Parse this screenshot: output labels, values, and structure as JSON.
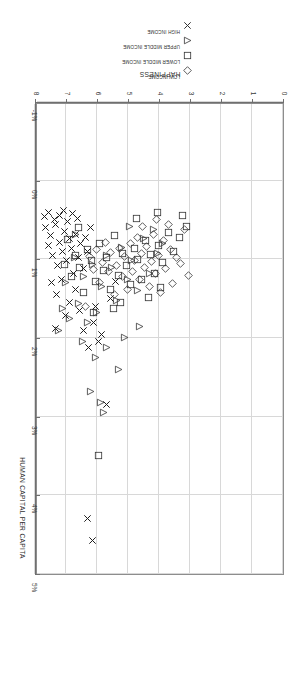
{
  "chart_data": {
    "type": "scatter",
    "title": "",
    "xlabel": "HAPPINESS",
    "ylabel": "HUMAN CAPITAL PER CAPITA",
    "xlim": [
      0,
      8
    ],
    "ylim": [
      -0.01,
      0.05
    ],
    "x_ticks": [
      "0",
      "1",
      "2",
      "3",
      "4",
      "5",
      "6",
      "7",
      "8"
    ],
    "x_tick_values": [
      0,
      1,
      2,
      3,
      4,
      5,
      6,
      7,
      8
    ],
    "y_ticks": [
      "-1%",
      "0%",
      "1%",
      "2%",
      "3%",
      "4%",
      "5%"
    ],
    "y_tick_values": [
      -0.01,
      0,
      0.01,
      0.02,
      0.03,
      0.04,
      0.05
    ],
    "grid": true,
    "rotated_180": true,
    "legend_position": "top-center",
    "series": [
      {
        "name": "LOW INCOME",
        "marker": "diamond",
        "color": "#333333",
        "points": [
          [
            3.05,
            0.012
          ],
          [
            3.3,
            0.0105
          ],
          [
            3.42,
            0.0098
          ],
          [
            3.55,
            0.0131
          ],
          [
            3.62,
            0.0088
          ],
          [
            3.78,
            0.0112
          ],
          [
            3.85,
            0.0076
          ],
          [
            3.95,
            0.0142
          ],
          [
            4.02,
            0.0095
          ],
          [
            4.1,
            0.0118
          ],
          [
            4.18,
            0.0068
          ],
          [
            4.25,
            0.0103
          ],
          [
            4.32,
            0.0135
          ],
          [
            4.4,
            0.0084
          ],
          [
            4.48,
            0.011
          ],
          [
            4.55,
            0.0092
          ],
          [
            4.62,
            0.0126
          ],
          [
            4.7,
            0.0072
          ],
          [
            4.78,
            0.0101
          ],
          [
            4.85,
            0.0115
          ],
          [
            4.92,
            0.008
          ],
          [
            5.02,
            0.0138
          ],
          [
            5.1,
            0.0097
          ],
          [
            5.18,
            0.0122
          ],
          [
            5.28,
            0.0086
          ],
          [
            5.38,
            0.0108
          ],
          [
            5.45,
            0.0145
          ],
          [
            5.55,
            0.0091
          ],
          [
            5.62,
            0.0116
          ],
          [
            5.72,
            0.0078
          ],
          [
            5.82,
            0.0104
          ],
          [
            5.92,
            0.0129
          ],
          [
            6.02,
            0.0088
          ],
          [
            6.12,
            0.0113
          ],
          [
            6.25,
            0.0096
          ],
          [
            6.38,
            0.016
          ],
          [
            3.18,
            0.0062
          ],
          [
            3.68,
            0.0056
          ],
          [
            4.08,
            0.005
          ],
          [
            4.52,
            0.0058
          ]
        ]
      },
      {
        "name": "LOWER MIDDLE INCOME",
        "marker": "square",
        "color": "#333333",
        "points": [
          [
            3.1,
            0.0058
          ],
          [
            3.35,
            0.0072
          ],
          [
            3.52,
            0.009
          ],
          [
            3.7,
            0.0066
          ],
          [
            3.88,
            0.0104
          ],
          [
            4.0,
            0.0082
          ],
          [
            4.15,
            0.0118
          ],
          [
            4.28,
            0.0094
          ],
          [
            4.42,
            0.0076
          ],
          [
            4.55,
            0.0126
          ],
          [
            4.68,
            0.01
          ],
          [
            4.8,
            0.0086
          ],
          [
            4.92,
            0.0132
          ],
          [
            5.05,
            0.0108
          ],
          [
            5.18,
            0.0092
          ],
          [
            5.3,
            0.012
          ],
          [
            5.42,
            0.007
          ],
          [
            5.55,
            0.0138
          ],
          [
            5.68,
            0.0098
          ],
          [
            5.8,
            0.0114
          ],
          [
            5.92,
            0.008
          ],
          [
            6.05,
            0.0128
          ],
          [
            6.18,
            0.0102
          ],
          [
            6.3,
            0.0088
          ],
          [
            6.42,
            0.0142
          ],
          [
            6.55,
            0.011
          ],
          [
            6.68,
            0.0095
          ],
          [
            6.82,
            0.0122
          ],
          [
            6.95,
            0.0075
          ],
          [
            7.05,
            0.0106
          ],
          [
            4.35,
            0.0148
          ],
          [
            5.48,
            0.0162
          ],
          [
            3.95,
            0.0136
          ],
          [
            6.1,
            0.0168
          ],
          [
            5.25,
            0.0155
          ],
          [
            5.95,
            0.035
          ],
          [
            3.25,
            0.0044
          ],
          [
            4.05,
            0.004
          ],
          [
            4.72,
            0.0048
          ],
          [
            6.6,
            0.006
          ]
        ]
      },
      {
        "name": "UPPER MIDDLE INCOME",
        "marker": "triangle-left",
        "color": "#333333",
        "points": [
          [
            4.05,
            0.0092
          ],
          [
            4.3,
            0.0118
          ],
          [
            4.5,
            0.0074
          ],
          [
            4.7,
            0.014
          ],
          [
            4.88,
            0.0102
          ],
          [
            5.02,
            0.0126
          ],
          [
            5.2,
            0.0085
          ],
          [
            5.38,
            0.0152
          ],
          [
            5.52,
            0.011
          ],
          [
            5.68,
            0.0095
          ],
          [
            5.85,
            0.0134
          ],
          [
            6.0,
            0.0168
          ],
          [
            6.15,
            0.0106
          ],
          [
            6.3,
            0.018
          ],
          [
            6.45,
            0.0122
          ],
          [
            6.6,
            0.0156
          ],
          [
            6.72,
            0.0098
          ],
          [
            6.88,
            0.0175
          ],
          [
            7.0,
            0.013
          ],
          [
            7.12,
            0.0162
          ],
          [
            7.25,
            0.019
          ],
          [
            5.1,
            0.02
          ],
          [
            5.7,
            0.0212
          ],
          [
            6.05,
            0.0225
          ],
          [
            4.62,
            0.0186
          ],
          [
            5.3,
            0.024
          ],
          [
            6.2,
            0.0268
          ],
          [
            5.9,
            0.0282
          ],
          [
            5.78,
            0.0295
          ],
          [
            6.48,
            0.0205
          ],
          [
            4.18,
            0.0062
          ],
          [
            4.95,
            0.0058
          ],
          [
            6.68,
            0.0068
          ],
          [
            3.9,
            0.008
          ]
        ]
      },
      {
        "name": "HIGH INCOME",
        "marker": "x",
        "color": "#1f1f1f",
        "points": [
          [
            7.65,
            0.006
          ],
          [
            7.58,
            0.0082
          ],
          [
            7.5,
            0.007
          ],
          [
            7.42,
            0.0095
          ],
          [
            7.35,
            0.0056
          ],
          [
            7.28,
            0.0108
          ],
          [
            7.2,
            0.0078
          ],
          [
            7.12,
            0.009
          ],
          [
            7.05,
            0.0064
          ],
          [
            6.98,
            0.0102
          ],
          [
            6.9,
            0.0074
          ],
          [
            6.82,
            0.0086
          ],
          [
            6.75,
            0.0118
          ],
          [
            6.68,
            0.0068
          ],
          [
            6.6,
            0.0098
          ],
          [
            6.52,
            0.008
          ],
          [
            6.45,
            0.0112
          ],
          [
            6.38,
            0.0072
          ],
          [
            6.3,
            0.009
          ],
          [
            6.22,
            0.006
          ],
          [
            7.7,
            0.0046
          ],
          [
            7.55,
            0.004
          ],
          [
            7.38,
            0.005
          ],
          [
            7.22,
            0.0044
          ],
          [
            7.08,
            0.0038
          ],
          [
            6.95,
            0.0052
          ],
          [
            6.8,
            0.0042
          ],
          [
            6.62,
            0.0048
          ],
          [
            7.48,
            0.013
          ],
          [
            7.3,
            0.0145
          ],
          [
            7.15,
            0.0126
          ],
          [
            6.88,
            0.0155
          ],
          [
            6.7,
            0.0138
          ],
          [
            7.02,
            0.0172
          ],
          [
            6.55,
            0.0165
          ],
          [
            7.35,
            0.0188
          ],
          [
            6.42,
            0.019
          ],
          [
            6.12,
            0.018
          ],
          [
            5.95,
            0.0205
          ],
          [
            6.28,
            0.0212
          ],
          [
            5.85,
            0.0196
          ],
          [
            6.05,
            0.016
          ],
          [
            5.7,
            0.0285
          ],
          [
            6.3,
            0.043
          ],
          [
            6.15,
            0.0458
          ],
          [
            5.55,
            0.015
          ],
          [
            5.4,
            0.0128
          ]
        ]
      }
    ]
  },
  "legend": {
    "items": [
      {
        "label": "LOW INCOME",
        "marker": "diamond"
      },
      {
        "label": "LOWER MIDDLE INCOME",
        "marker": "square"
      },
      {
        "label": "UPPER MIDDLE INCOME",
        "marker": "triangle-left"
      },
      {
        "label": "HIGH INCOME",
        "marker": "x"
      }
    ]
  },
  "axes": {
    "x_title": "HAPPINESS",
    "y_title": "HUMAN CAPITAL PER CAPITA"
  }
}
